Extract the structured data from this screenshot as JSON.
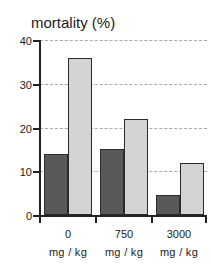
{
  "chart_data": {
    "type": "bar",
    "title": "mortality (%)",
    "xlabel": "",
    "ylabel": "",
    "ylim": [
      0,
      40
    ],
    "yticks": [
      0,
      10,
      20,
      30,
      40
    ],
    "grid": true,
    "legend": "none",
    "categories": [
      "0",
      "750",
      "3000"
    ],
    "category_units": [
      "mg / kg",
      "mg / kg",
      "mg / kg"
    ],
    "series": [
      {
        "name": "dark",
        "color": "#595959",
        "values": [
          14,
          15,
          4.5
        ]
      },
      {
        "name": "light",
        "color": "#d4d4d4",
        "values": [
          36,
          22,
          12
        ]
      }
    ]
  },
  "axis": {
    "y_labels": [
      "40",
      "30",
      "20",
      "10",
      "0"
    ]
  }
}
